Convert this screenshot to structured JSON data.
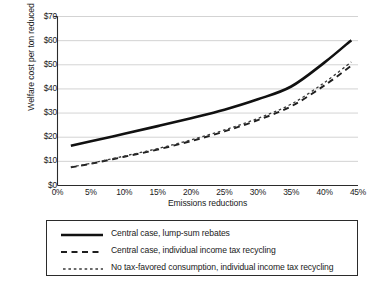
{
  "chart_data": {
    "type": "line",
    "title": "",
    "xlabel": "Emissions reductions",
    "ylabel": "Welfare cost per ton reduced",
    "xlim": [
      0,
      45
    ],
    "ylim": [
      0,
      70
    ],
    "grid": true,
    "legend_position": "bottom",
    "x_tick_labels": [
      "0%",
      "5%",
      "10%",
      "15%",
      "20%",
      "25%",
      "30%",
      "35%",
      "40%",
      "45%"
    ],
    "x_tick_values": [
      0,
      5,
      10,
      15,
      20,
      25,
      30,
      35,
      40,
      45
    ],
    "y_tick_labels": [
      "$0",
      "$10",
      "$20",
      "$30",
      "$40",
      "$50",
      "$60",
      "$70"
    ],
    "y_tick_values": [
      0,
      10,
      20,
      30,
      40,
      50,
      60,
      70
    ],
    "x": [
      2,
      5,
      10,
      15,
      20,
      25,
      30,
      35,
      40,
      44
    ],
    "series": [
      {
        "name": "Central case, lump-sum rebates",
        "style": "solid",
        "color": "#111111",
        "values": [
          16.5,
          18.3,
          21.4,
          24.6,
          27.9,
          31.4,
          35.7,
          41.0,
          51.0,
          60.2
        ]
      },
      {
        "name": "Central case, individual income tax recycling",
        "style": "dashed",
        "color": "#1f1f1f",
        "values": [
          7.5,
          9.0,
          11.9,
          14.9,
          18.4,
          22.4,
          27.1,
          32.8,
          41.5,
          49.6
        ]
      },
      {
        "name": "No tax-favored consumption, individual income tax recycling",
        "style": "dotted",
        "color": "#3a3a3a",
        "values": [
          7.7,
          9.2,
          12.2,
          15.3,
          18.9,
          23.0,
          27.8,
          33.7,
          42.7,
          51.2
        ]
      }
    ]
  },
  "legend": {
    "items": [
      {
        "label": "Central case, lump-sum rebates"
      },
      {
        "label": "Central case, individual income tax recycling"
      },
      {
        "label": "No tax-favored consumption, individual income tax recycling"
      }
    ]
  }
}
